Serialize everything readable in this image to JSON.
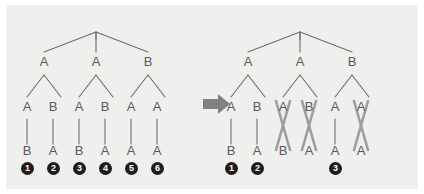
{
  "figure": {
    "background_color": "#efefed",
    "line_color": "#6e6e6e",
    "label_color": "#5a5a5a",
    "cross_color": "#9a9a9a",
    "circle_color": "#1d1d1d",
    "arrow_color": "#808080",
    "arrow_icon": "right-arrow-icon"
  },
  "left_tree": {
    "caption": "before",
    "root": "",
    "level1": [
      "A",
      "A",
      "B"
    ],
    "level2": [
      "A",
      "B",
      "A",
      "B",
      "A",
      "A"
    ],
    "leaves": [
      "B",
      "A",
      "B",
      "A",
      "A",
      "A"
    ],
    "taxon_numbers": [
      "1",
      "2",
      "3",
      "4",
      "5",
      "6"
    ],
    "taxon_columns": [
      0,
      1,
      2,
      3,
      4,
      5
    ],
    "crossed_columns": []
  },
  "right_tree": {
    "caption": "after",
    "root": "",
    "level1": [
      "A",
      "A",
      "B"
    ],
    "level2": [
      "A",
      "B",
      "A",
      "B",
      "A",
      "A"
    ],
    "leaves": [
      "B",
      "A",
      "B",
      "A",
      "A",
      "A"
    ],
    "taxon_numbers": [
      "1",
      "2",
      "3"
    ],
    "taxon_columns": [
      0,
      1,
      4
    ],
    "crossed_columns": [
      2,
      3,
      5
    ]
  }
}
